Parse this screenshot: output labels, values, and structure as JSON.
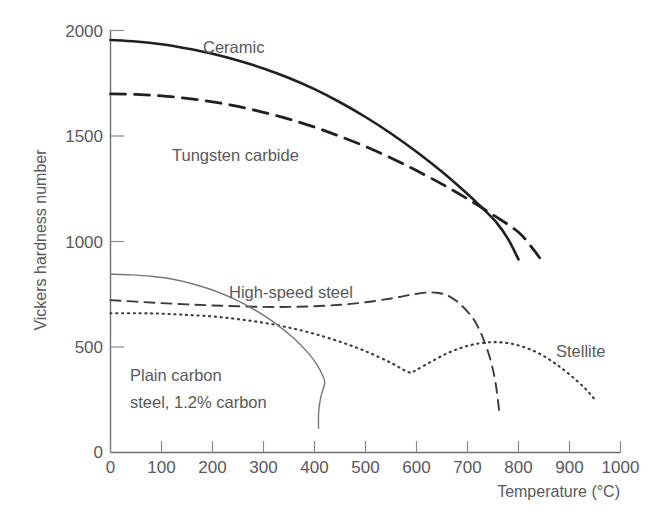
{
  "chart_data": {
    "type": "line",
    "title": "",
    "xlabel": "Temperature (°C)",
    "ylabel": "Vickers hardness number",
    "xlim": [
      0,
      1000
    ],
    "ylim": [
      0,
      2000
    ],
    "xticks": [
      0,
      100,
      200,
      300,
      400,
      500,
      600,
      700,
      800,
      900,
      1000
    ],
    "yticks": [
      0,
      500,
      1000,
      1500,
      2000
    ],
    "grid": false,
    "legend": "inline-annotations",
    "series": [
      {
        "name": "Ceramic",
        "style": "solid-thick",
        "color": "#231f20",
        "label_x": 290,
        "label_y": 1880,
        "points": [
          [
            0,
            1955
          ],
          [
            50,
            1948
          ],
          [
            100,
            1935
          ],
          [
            150,
            1915
          ],
          [
            200,
            1890
          ],
          [
            250,
            1858
          ],
          [
            300,
            1820
          ],
          [
            350,
            1775
          ],
          [
            400,
            1722
          ],
          [
            450,
            1660
          ],
          [
            500,
            1590
          ],
          [
            550,
            1512
          ],
          [
            600,
            1425
          ],
          [
            650,
            1330
          ],
          [
            700,
            1225
          ],
          [
            725,
            1168
          ],
          [
            755,
            1095
          ],
          [
            780,
            1010
          ],
          [
            800,
            915
          ]
        ]
      },
      {
        "name": "Tungsten carbide",
        "style": "dashed-thick",
        "color": "#231f20",
        "label_x": 195,
        "label_y": 1455,
        "points": [
          [
            0,
            1700
          ],
          [
            50,
            1697
          ],
          [
            100,
            1690
          ],
          [
            150,
            1678
          ],
          [
            200,
            1662
          ],
          [
            250,
            1640
          ],
          [
            300,
            1612
          ],
          [
            350,
            1580
          ],
          [
            400,
            1542
          ],
          [
            450,
            1498
          ],
          [
            500,
            1450
          ],
          [
            550,
            1396
          ],
          [
            600,
            1336
          ],
          [
            650,
            1272
          ],
          [
            700,
            1202
          ],
          [
            750,
            1126
          ],
          [
            800,
            1044
          ],
          [
            830,
            960
          ],
          [
            845,
            910
          ]
        ]
      },
      {
        "name": "High-speed steel",
        "style": "dashed-thin",
        "color": "#3b3b3d",
        "label_x": 345,
        "label_y": 790,
        "points": [
          [
            0,
            722
          ],
          [
            50,
            715
          ],
          [
            100,
            708
          ],
          [
            150,
            702
          ],
          [
            200,
            697
          ],
          [
            250,
            693
          ],
          [
            300,
            690
          ],
          [
            350,
            690
          ],
          [
            400,
            693
          ],
          [
            450,
            700
          ],
          [
            500,
            712
          ],
          [
            550,
            730
          ],
          [
            590,
            748
          ],
          [
            620,
            758
          ],
          [
            640,
            757
          ],
          [
            660,
            745
          ],
          [
            680,
            715
          ],
          [
            700,
            668
          ],
          [
            715,
            620
          ],
          [
            730,
            545
          ],
          [
            745,
            440
          ],
          [
            755,
            330
          ],
          [
            762,
            200
          ]
        ]
      },
      {
        "name": "Stellite",
        "style": "dotted",
        "color": "#3b3b3d",
        "label_x": 855,
        "label_y": 500,
        "points": [
          [
            0,
            660
          ],
          [
            50,
            660
          ],
          [
            100,
            658
          ],
          [
            150,
            652
          ],
          [
            200,
            645
          ],
          [
            250,
            632
          ],
          [
            300,
            615
          ],
          [
            350,
            592
          ],
          [
            400,
            562
          ],
          [
            450,
            525
          ],
          [
            500,
            480
          ],
          [
            550,
            425
          ],
          [
            585,
            380
          ],
          [
            600,
            392
          ],
          [
            630,
            432
          ],
          [
            660,
            470
          ],
          [
            690,
            498
          ],
          [
            720,
            516
          ],
          [
            750,
            523
          ],
          [
            780,
            518
          ],
          [
            810,
            500
          ],
          [
            840,
            470
          ],
          [
            870,
            425
          ],
          [
            900,
            370
          ],
          [
            930,
            305
          ],
          [
            950,
            250
          ]
        ]
      },
      {
        "name": "Plain carbon steel, 1.2% carbon",
        "style": "thin-solid",
        "color": "#77777a",
        "label_x": 115,
        "label_y": 415,
        "points": [
          [
            0,
            845
          ],
          [
            40,
            842
          ],
          [
            80,
            835
          ],
          [
            120,
            822
          ],
          [
            160,
            800
          ],
          [
            200,
            770
          ],
          [
            240,
            730
          ],
          [
            280,
            680
          ],
          [
            320,
            618
          ],
          [
            360,
            540
          ],
          [
            390,
            465
          ],
          [
            405,
            415
          ],
          [
            415,
            370
          ],
          [
            420,
            330
          ],
          [
            412,
            260
          ],
          [
            408,
            185
          ],
          [
            408,
            115
          ]
        ]
      }
    ],
    "annotations": [
      {
        "name": "ceramic-label",
        "text": "Ceramic",
        "x": 290,
        "y": 1880
      },
      {
        "name": "tungsten-carbide-label",
        "text": "Tungsten carbide",
        "x": 195,
        "y": 1455
      },
      {
        "name": "high-speed-steel-label",
        "text": "High-speed steel",
        "x": 345,
        "y": 790
      },
      {
        "name": "stellite-label",
        "text": "Stellite",
        "x": 855,
        "y": 500
      },
      {
        "name": "plain-carbon-steel-label-line1",
        "text": "Plain carbon",
        "x": 115,
        "y": 425
      },
      {
        "name": "plain-carbon-steel-label-line2",
        "text": "steel, 1.2% carbon",
        "x": 115,
        "y": 330
      }
    ]
  },
  "labels": {
    "y_axis_title": "Vickers hardness number",
    "x_axis_title": "Temperature (°C)",
    "yticks": [
      "0",
      "500",
      "1000",
      "1500",
      "2000"
    ],
    "xticks": [
      "0",
      "100",
      "200",
      "300",
      "400",
      "500",
      "600",
      "700",
      "800",
      "900",
      "1000"
    ],
    "ceramic": "Ceramic",
    "tungsten_carbide": "Tungsten carbide",
    "high_speed_steel": "High-speed steel",
    "stellite": "Stellite",
    "plain_carbon_line1": "Plain carbon",
    "plain_carbon_line2": "steel, 1.2% carbon"
  },
  "colors": {
    "background": "#ffffff",
    "axis": "#6e6e6e",
    "text": "#59595b",
    "curve_dark": "#231f20",
    "curve_mid": "#3b3b3d",
    "curve_light": "#77777a"
  }
}
